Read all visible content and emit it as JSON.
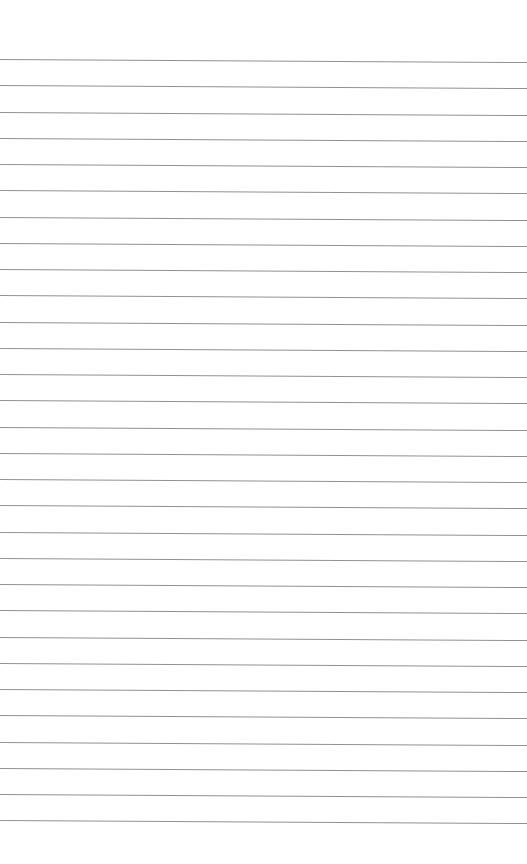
{
  "page": {
    "type": "ruled-paper",
    "background_color": "#ffffff",
    "line_color": "#8c8c8c",
    "line_count": 30,
    "first_line_y": 59,
    "line_spacing": 26.25,
    "line_slope_px": 3
  }
}
